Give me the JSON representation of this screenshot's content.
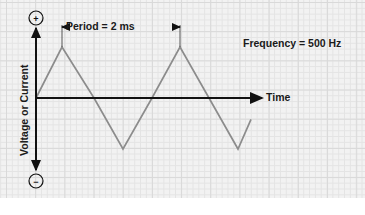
{
  "figure": {
    "title_text": "",
    "background_color": "#f2f2f2",
    "grid_minor_color": "#e4e4e4",
    "grid_major_color": "#d9d9d9",
    "axis_color": "#111111",
    "waveform_color": "#8c8c8c"
  },
  "labels": {
    "period": "Period = 2 ms",
    "frequency": "Frequency = 500 Hz",
    "time_axis": "Time",
    "y_axis": "Voltage or Current",
    "positive_symbol": "+",
    "negative_symbol": "−"
  },
  "chart_data": {
    "type": "line",
    "title": "",
    "xlabel": "Time",
    "ylabel": "Voltage or Current",
    "waveform": "triangle",
    "period_value": 2,
    "period_unit": "ms",
    "frequency_value": 500,
    "frequency_unit": "Hz",
    "grid": true,
    "legend": "none",
    "annotations": [
      {
        "text": "Period = 2 ms",
        "type": "dimension-arrow",
        "from_x": 62,
        "to_x": 180
      },
      {
        "text": "Frequency = 500 Hz",
        "type": "text",
        "x": 243,
        "y": 43
      }
    ],
    "points": [
      {
        "x": 36,
        "y": 0
      },
      {
        "x": 62,
        "y": 1
      },
      {
        "x": 94,
        "y": 0
      },
      {
        "x": 123,
        "y": -1
      },
      {
        "x": 152,
        "y": 0
      },
      {
        "x": 180,
        "y": 1
      },
      {
        "x": 209,
        "y": 0
      },
      {
        "x": 238,
        "y": -1
      },
      {
        "x": 251,
        "y": -0.42
      }
    ],
    "axis_x_range": [
      36,
      258
    ],
    "axis_y_range": [
      -1.6,
      1.6
    ],
    "zero_line_y": 98
  }
}
